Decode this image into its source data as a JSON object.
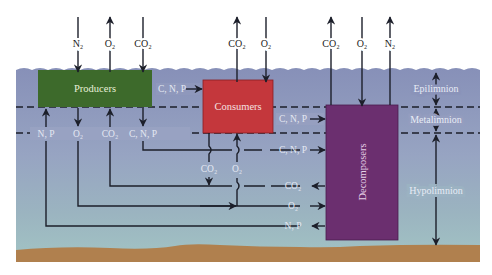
{
  "diagram": {
    "compartments": {
      "producers": "Producers",
      "consumers": "Consumers",
      "decomposers": "Decomposers"
    },
    "zones": {
      "epilimnion": "Epilimnion",
      "metalimnion": "Metalimnion",
      "hypolimnion": "Hypolimnion"
    },
    "atmosphere_exchange": [
      {
        "label": "N₂",
        "direction": "in",
        "target": "producers"
      },
      {
        "label": "O₂",
        "direction": "out",
        "target": "producers"
      },
      {
        "label": "CO₂",
        "direction": "in",
        "target": "producers"
      },
      {
        "label": "CO₂",
        "direction": "out",
        "target": "consumers"
      },
      {
        "label": "O₂",
        "direction": "in",
        "target": "consumers"
      },
      {
        "label": "CO₂",
        "direction": "out",
        "target": "decomposers"
      },
      {
        "label": "O₂",
        "direction": "in",
        "target": "decomposers"
      },
      {
        "label": "N₂",
        "direction": "out",
        "target": "decomposers"
      }
    ],
    "flows": {
      "producers_to_consumers": "C, N, P",
      "consumers_to_decomposers_meta": "C, N, P",
      "producers_bottom": [
        "N, P",
        "O₂",
        "CO₂",
        "C, N, P"
      ],
      "consumers_bottom": [
        "CO₂",
        "O₂"
      ],
      "to_decomposers": [
        "C, N, P",
        "CO₂",
        "O₂",
        "N, P"
      ]
    },
    "colors": {
      "producers": "#3d6b2a",
      "consumers": "#c4343a",
      "decomposers": "#6b2f6e",
      "water_top": "#8a92b8",
      "water_bottom": "#9cbcbe",
      "sediment": "#b07e4c"
    }
  }
}
